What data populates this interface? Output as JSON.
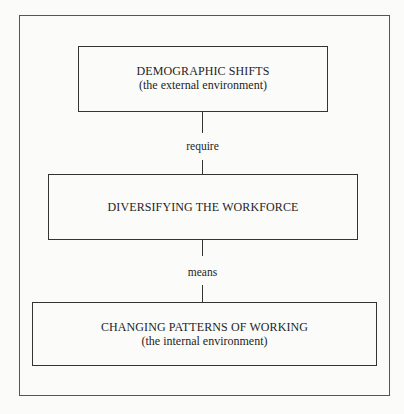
{
  "diagram": {
    "type": "flow-chart",
    "orientation": "vertical",
    "colors": {
      "background": "#fbfbf9",
      "line": "#333333",
      "text": "#1e1e1e",
      "frame": "#555555"
    },
    "nodes": [
      {
        "id": "top",
        "title": "DEMOGRAPHIC SHIFTS",
        "subtitle": "(the external environment)"
      },
      {
        "id": "middle",
        "title": "DIVERSIFYING THE WORKFORCE",
        "subtitle": ""
      },
      {
        "id": "bottom",
        "title": "CHANGING PATTERNS OF WORKING",
        "subtitle": "(the internal environment)"
      }
    ],
    "edges": [
      {
        "from": "top",
        "to": "middle",
        "label": "require"
      },
      {
        "from": "middle",
        "to": "bottom",
        "label": "means"
      }
    ]
  }
}
